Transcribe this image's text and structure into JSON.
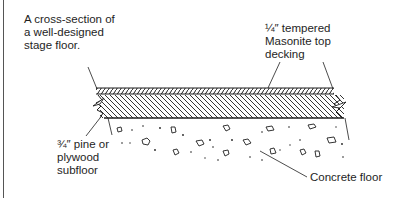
{
  "caption": {
    "lines": [
      "A cross-section of",
      "a well-designed",
      "stage floor."
    ]
  },
  "labels": {
    "top_decking": [
      "¼″ tempered",
      "Masonite top",
      "decking"
    ],
    "subfloor": [
      "¾″ pine or",
      "plywood",
      "subfloor"
    ],
    "concrete": "Concrete floor"
  },
  "layers": [
    {
      "name": "Masonite top decking",
      "thickness": "¼″",
      "pattern": "fine diagonal hatch"
    },
    {
      "name": "pine or plywood subfloor",
      "thickness": "¾″",
      "pattern": "coarse diagonal hatch"
    },
    {
      "name": "Concrete floor",
      "pattern": "aggregate stipple"
    }
  ],
  "colors": {
    "ink": "#1e1e1e",
    "background": "#ffffff"
  }
}
